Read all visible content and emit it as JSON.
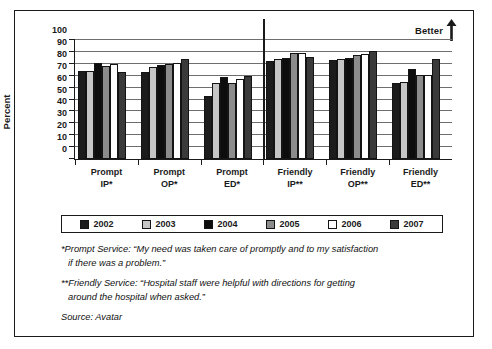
{
  "chart_data": {
    "type": "bar",
    "title": "",
    "xlabel": "",
    "ylabel": "Percent",
    "ylim": [
      0,
      100
    ],
    "ytick_values": [
      0,
      10,
      20,
      30,
      40,
      50,
      60,
      70,
      80,
      90,
      100
    ],
    "ytick_labels": [
      "0",
      "10",
      "20",
      "30",
      "40",
      "50",
      "60",
      "70",
      "80",
      "90",
      "100"
    ],
    "grid": true,
    "legend_position": "below-plot",
    "categories": [
      "Prompt IP*",
      "Prompt OP*",
      "Prompt ED*",
      "Friendly IP**",
      "Friendly OP**",
      "Friendly ED**"
    ],
    "category_lines": [
      [
        "Prompt",
        "IP*"
      ],
      [
        "Prompt",
        "OP*"
      ],
      [
        "Prompt",
        "ED*"
      ],
      [
        "Friendly",
        "IP**"
      ],
      [
        "Friendly",
        "OP**"
      ],
      [
        "Friendly",
        "ED**"
      ]
    ],
    "series": [
      {
        "name": "2002",
        "color": "#1c1c1c",
        "values": [
          74,
          73,
          53,
          82,
          83,
          64
        ]
      },
      {
        "name": "2003",
        "color": "#c6c6c6",
        "values": [
          74,
          77,
          64,
          84,
          84,
          65
        ]
      },
      {
        "name": "2004",
        "color": "#0d0d0d",
        "values": [
          81,
          79,
          69,
          85,
          85,
          76
        ]
      },
      {
        "name": "2005",
        "color": "#8c8c8c",
        "values": [
          78,
          80,
          64,
          89,
          87,
          71
        ]
      },
      {
        "name": "2006",
        "color": "#ffffff",
        "values": [
          80,
          81,
          67,
          89,
          88,
          71
        ]
      },
      {
        "name": "2007",
        "color": "#3a3a3a",
        "values": [
          73,
          84,
          70,
          86,
          91,
          84
        ]
      }
    ],
    "annotations": [
      {
        "text": "Better",
        "position": "top-right",
        "icon": "up-arrow"
      }
    ]
  },
  "annotation": {
    "better_label": "Better"
  },
  "notes": {
    "prompt": "*Prompt Service: “My need was taken care of promptly and to my satisfaction",
    "prompt_cont": "if there was a problem.”",
    "friendly": "**Friendly Service: “Hospital staff were helpful with directions for getting",
    "friendly_cont": "around the hospital when asked.”",
    "source": "Source: Avatar"
  }
}
